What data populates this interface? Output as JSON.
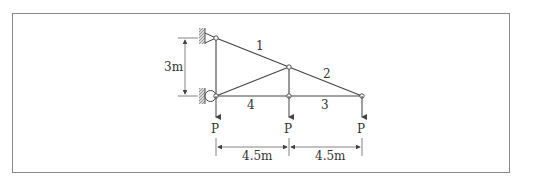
{
  "diagram": {
    "type": "truss",
    "supports": [
      {
        "name": "pin-support",
        "position": "top-left"
      },
      {
        "name": "roller-support",
        "position": "bottom-left"
      }
    ],
    "members": [
      {
        "label": "1"
      },
      {
        "label": "2"
      },
      {
        "label": "3"
      },
      {
        "label": "4"
      }
    ],
    "loads": [
      {
        "label": "P"
      },
      {
        "label": "P"
      },
      {
        "label": "P"
      }
    ],
    "dimensions": {
      "height": "3m",
      "span_left": "4.5m",
      "span_right": "4.5m"
    },
    "colors": {
      "line": "#444444",
      "frame": "#8a8a8a",
      "hatch": "#999999"
    }
  }
}
